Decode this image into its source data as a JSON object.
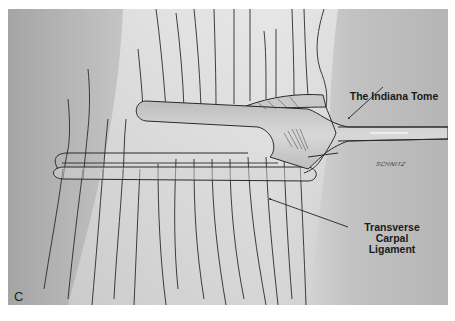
{
  "figure": {
    "panel_letter": "C",
    "labels": {
      "instrument": "The Indiana Tome",
      "ligament_lines": [
        "Transverse",
        "Carpal",
        "Ligament"
      ]
    },
    "signature": "SCHNITZ",
    "colors": {
      "background_left": "#a9a9a9",
      "background_right": "#b4b4b4",
      "tissue": "#dedede",
      "instrument": "#c4c4c4",
      "line": "#2a2a2a"
    }
  }
}
